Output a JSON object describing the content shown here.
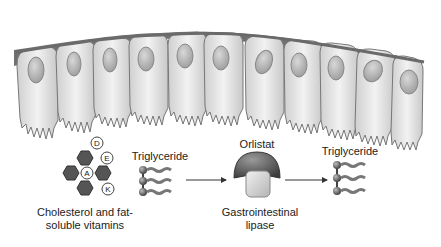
{
  "diagram": {
    "title": "",
    "epithelium": {
      "label": "",
      "cell_count": 11
    },
    "molecules": {
      "cholesterol_vitamins": {
        "label_line1": "Cholesterol and fat-",
        "label_line2": "soluble vitamins",
        "vitamins": [
          "D",
          "E",
          "A",
          "K"
        ]
      },
      "triglyceride_left": {
        "label": "Triglyceride"
      },
      "orlistat": {
        "label": "Orlistat"
      },
      "lipase": {
        "label_line1": "Gastrointestinal",
        "label_line2": "lipase"
      },
      "triglyceride_right": {
        "label": "Triglyceride"
      }
    },
    "colors": {
      "cell_fill": "#e4e4e4",
      "cell_stroke": "#777777",
      "membrane": "#707070",
      "nucleus": "#bdbdbd",
      "hexagon": "#555555",
      "orlistat": "#5a5a5a",
      "lipase": "#cfcfcf",
      "arrow": "#333333"
    }
  }
}
